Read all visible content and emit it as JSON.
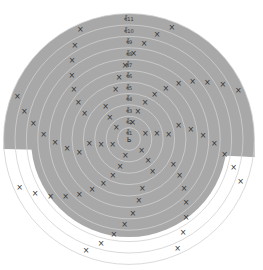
{
  "colors": {
    "shade": "#a8a8a8",
    "ring_line": "#d0d0d0",
    "stitch": "#333333",
    "background": "#ffffff"
  },
  "center": {
    "x": 129,
    "y": 139
  },
  "ring_spacing": 11.4,
  "ring_count": 11,
  "row_labels": [
    "ชั้11",
    "ชั้10",
    "ชั้9",
    "ชั้8",
    "ชั้7",
    "ชั้6",
    "ชั้5",
    "ชั้4",
    "ชั้3",
    "ชั้2",
    "ชั้1"
  ],
  "center_symbol": "ь",
  "stitch_symbol": "×",
  "legend": {
    "single_crochet": "×",
    "increase": "V"
  }
}
